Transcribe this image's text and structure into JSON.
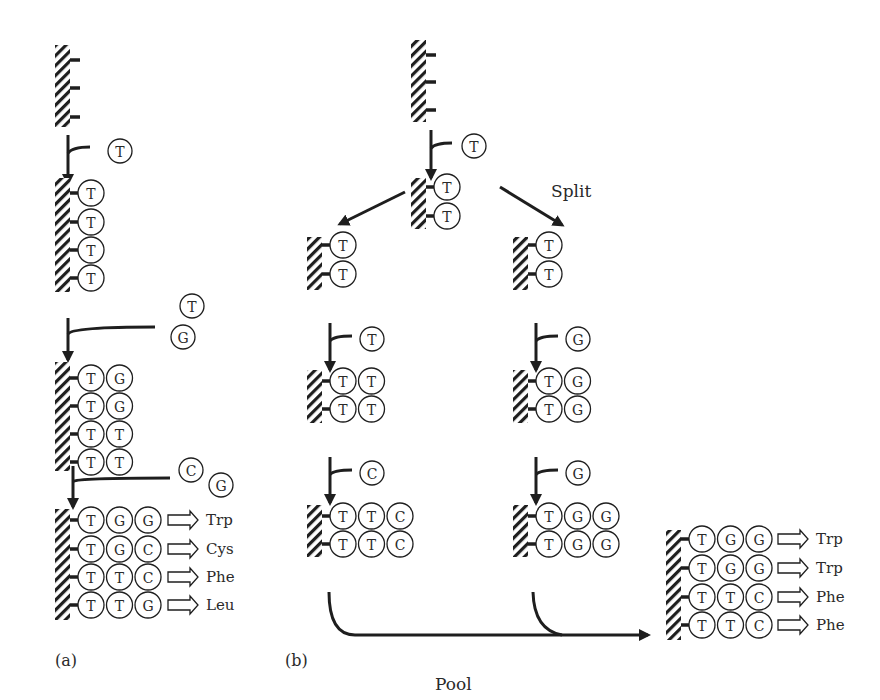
{
  "diagram": {
    "colors": {
      "ink": "#1e1e1e",
      "text": "#2a2a2a",
      "background": "#ffffff"
    },
    "panels": {
      "a": {
        "label": "(a)"
      },
      "b": {
        "label": "(b)",
        "split_label": "Split",
        "pool_label": "Pool"
      }
    },
    "panel_a": {
      "steps": [
        {
          "stage": "initial",
          "rows": [
            [],
            [],
            []
          ]
        },
        {
          "stage": "couple-1",
          "added": [
            "T"
          ],
          "rows": [
            [
              "T"
            ],
            [
              "T"
            ],
            [
              "T"
            ],
            [
              "T"
            ]
          ]
        },
        {
          "stage": "couple-2",
          "added": [
            "T",
            "G"
          ],
          "rows": [
            [
              "T",
              "G"
            ],
            [
              "T",
              "G"
            ],
            [
              "T",
              "T"
            ],
            [
              "T",
              "T"
            ]
          ]
        },
        {
          "stage": "couple-3",
          "added": [
            "C",
            "G"
          ],
          "rows": [
            [
              "T",
              "G",
              "G"
            ],
            [
              "T",
              "G",
              "C"
            ],
            [
              "T",
              "T",
              "C"
            ],
            [
              "T",
              "T",
              "G"
            ]
          ],
          "products": [
            "Trp",
            "Cys",
            "Phe",
            "Leu"
          ]
        }
      ]
    },
    "panel_b": {
      "top": {
        "initial_rows": [
          [],
          [],
          []
        ],
        "added": [
          "T"
        ],
        "rows": [
          [
            "T"
          ],
          [
            "T"
          ]
        ]
      },
      "left_branch": {
        "split_rows": [
          [
            "T"
          ],
          [
            "T"
          ]
        ],
        "step2": {
          "added": [
            "T"
          ],
          "rows": [
            [
              "T",
              "T"
            ],
            [
              "T",
              "T"
            ]
          ]
        },
        "step3": {
          "added": [
            "C"
          ],
          "rows": [
            [
              "T",
              "T",
              "C"
            ],
            [
              "T",
              "T",
              "C"
            ]
          ]
        }
      },
      "right_branch": {
        "split_rows": [
          [
            "T"
          ],
          [
            "T"
          ]
        ],
        "step2": {
          "added": [
            "G"
          ],
          "rows": [
            [
              "T",
              "G"
            ],
            [
              "T",
              "G"
            ]
          ]
        },
        "step3": {
          "added": [
            "G"
          ],
          "rows": [
            [
              "T",
              "G",
              "G"
            ],
            [
              "T",
              "G",
              "G"
            ]
          ]
        }
      },
      "pooled": {
        "rows": [
          [
            "T",
            "G",
            "G"
          ],
          [
            "T",
            "G",
            "G"
          ],
          [
            "T",
            "T",
            "C"
          ],
          [
            "T",
            "T",
            "C"
          ]
        ],
        "products": [
          "Trp",
          "Trp",
          "Phe",
          "Phe"
        ]
      }
    }
  }
}
